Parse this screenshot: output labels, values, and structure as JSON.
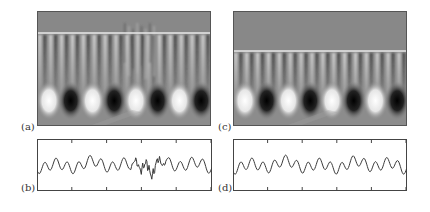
{
  "figure": {
    "panels": [
      {
        "id": "a",
        "label": "(a)",
        "type": "field-image",
        "interface_y_frac": 0.19,
        "disturbed": true
      },
      {
        "id": "b",
        "label": "(b)",
        "type": "waveform",
        "disturbed": true
      },
      {
        "id": "c",
        "label": "(c)",
        "type": "field-image",
        "interface_y_frac": 0.35,
        "disturbed": false
      },
      {
        "id": "d",
        "label": "(d)",
        "type": "waveform",
        "disturbed": false
      }
    ]
  },
  "chart_data": [
    {
      "type": "heatmap",
      "panel": "(a)",
      "title": "",
      "description": "Grayscale field with bright interface line near top and striations with irregular spikes in center; row of alternating bright/dark blobs near bottom",
      "blob_pattern": [
        "bright",
        "dark",
        "bright",
        "dark",
        "bright",
        "dark",
        "bright",
        "dark"
      ]
    },
    {
      "type": "line",
      "panel": "(b)",
      "title": "",
      "xlabel": "",
      "ylabel": "",
      "ticks_top": 5,
      "ticks_bottom": 5,
      "description": "Oscillating waveform with high-frequency disturbance between ~52% and ~75% of width"
    },
    {
      "type": "heatmap",
      "panel": "(c)",
      "title": "",
      "description": "Grayscale field with interface line lower, regular striations; row of alternating bright/dark blobs",
      "blob_pattern": [
        "bright",
        "dark",
        "bright",
        "dark",
        "bright",
        "dark",
        "bright",
        "dark"
      ]
    },
    {
      "type": "line",
      "panel": "(d)",
      "title": "",
      "xlabel": "",
      "ylabel": "",
      "ticks_top": 5,
      "ticks_bottom": 5,
      "description": "Smooth oscillating waveform, undisturbed"
    }
  ]
}
